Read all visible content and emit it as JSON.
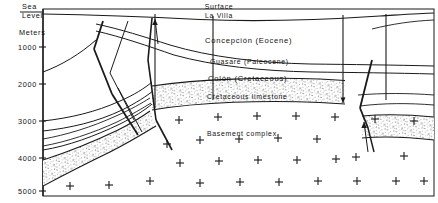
{
  "figure": {
    "type": "geologic-cross-section",
    "axis": {
      "title": "Meters",
      "datum_label_line1": "Sea",
      "datum_label_line2": "Level",
      "ticks": [
        "1000",
        "2000",
        "3000",
        "4000",
        "5000"
      ],
      "unit": "Meters",
      "range_top": 0,
      "range_bottom": 5000
    },
    "surface": {
      "label": "Surface",
      "locality": "La Villa"
    },
    "units": [
      {
        "name": "Concepción",
        "age": "(Eocene)",
        "label": "Concepción   (Eocene)"
      },
      {
        "name": "Guasare",
        "age": "(Paleocene)",
        "label": "Guasare   (Paleocene)"
      },
      {
        "name": "Colón",
        "age": "(Cretaceous)",
        "label": "Colón   (Cretaceous)"
      },
      {
        "name": "Cretaceous limestone",
        "age": "",
        "label": "Cretaceous  limestone"
      },
      {
        "name": "Basement complex",
        "age": "",
        "label": "Basement  complex"
      }
    ],
    "colors": {
      "line": "#1a1a1a",
      "background": "#ffffff",
      "stipple": "#2b2b2b"
    }
  }
}
